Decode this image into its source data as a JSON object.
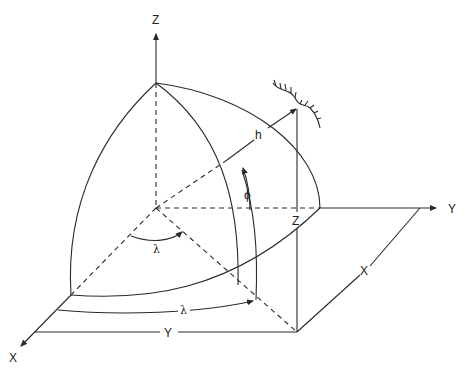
{
  "diagram": {
    "axes": {
      "z_label": "Z",
      "y_label": "Y",
      "x_label": "X"
    },
    "symbols": {
      "lambda_center": "λ",
      "lambda_equator": "λ",
      "phi": "ϕ",
      "height": "h",
      "z_height": "Z",
      "y_distance": "Y",
      "x_distance": "X"
    },
    "colors": {
      "line": "#2a2a2a",
      "background": "#ffffff"
    }
  }
}
